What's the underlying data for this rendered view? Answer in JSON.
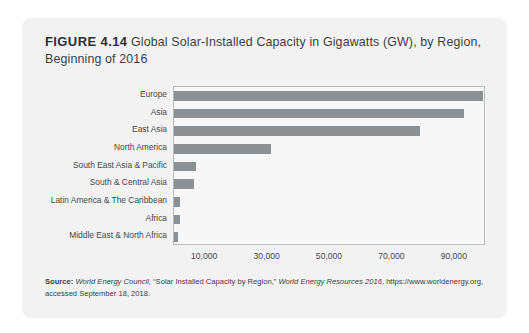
{
  "figure": {
    "number_label": "FIGURE 4.14",
    "title": "Global Solar-Installed Capacity in Gigawatts (GW), by Region, Beginning of 2016"
  },
  "source": {
    "label": "Source:",
    "publisher": "World Energy Council,",
    "article": "“Solar Installed Capacity by Region,”",
    "publication": "World Energy Resources 2016",
    "tail": ",",
    "line2": "https://www.worldenergy.org, accessed September 18, 2018."
  },
  "colors": {
    "bar": "#8d9092",
    "card_background": "#f2f2f2",
    "plot_background": "#f7f7f7",
    "plot_border": "#b9bcbe",
    "text": "#3b3f43"
  },
  "chart_data": {
    "type": "bar",
    "orientation": "horizontal",
    "title": "Global Solar-Installed Capacity in Gigawatts (GW), by Region, Beginning of 2016",
    "xlabel": "",
    "ylabel": "",
    "grid": false,
    "legend": false,
    "xlim": [
      0,
      100000
    ],
    "xticks": [
      10000,
      30000,
      50000,
      70000,
      90000
    ],
    "xtick_labels": [
      "10,000",
      "30,000",
      "50,000",
      "70,000",
      "90,000"
    ],
    "categories": [
      "Europe",
      "Asia",
      "East Asia",
      "North America",
      "South East Asia & Pacific",
      "South & Central Asia",
      "Latin America & The Caribbean",
      "Africa",
      "Middle East & North Africa"
    ],
    "values": [
      99000,
      93000,
      79000,
      31000,
      7000,
      6500,
      2000,
      1800,
      1200
    ]
  }
}
